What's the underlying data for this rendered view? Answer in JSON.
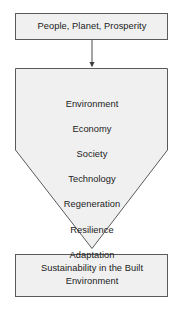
{
  "figure": {
    "type": "flow-diagram",
    "orientation": "vertical",
    "background_color": "#ffffff",
    "node_fill_color": "#f0f0f0",
    "node_stroke_color": "#5a5a5a",
    "text_color": "#1b1b1b",
    "connector_color": "#4a4a4a"
  },
  "nodes": {
    "input": {
      "shape": "rectangle",
      "label": "People, Planet, Prosperity"
    },
    "process": {
      "shape": "pentagon-down",
      "items": [
        "Environment",
        "Economy",
        "Society",
        "Technology",
        "Regeneration",
        "Resilience",
        "Adaptation"
      ]
    },
    "output": {
      "shape": "rectangle",
      "label": "Sustainability in the Built\nEnvironment"
    }
  },
  "connectors": [
    {
      "name": "input-to-process",
      "style": "arrow",
      "from": "input",
      "to": "process"
    },
    {
      "name": "process-to-output",
      "style": "point-contact",
      "from": "process",
      "to": "output"
    }
  ]
}
